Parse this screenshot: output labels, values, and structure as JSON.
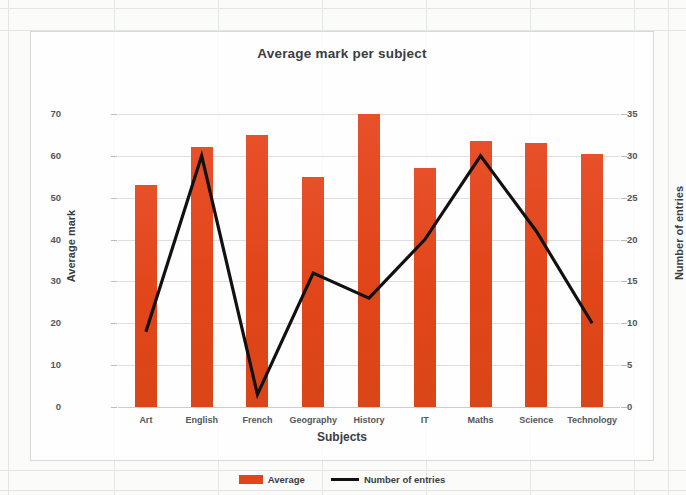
{
  "chart_data": {
    "type": "bar",
    "title": "Average mark per subject",
    "xlabel": "Subjects",
    "ylabel": "Average mark",
    "y2label": "Number of entries",
    "categories": [
      "Art",
      "English",
      "French",
      "Geography",
      "History",
      "IT",
      "Maths",
      "Science",
      "Technology"
    ],
    "ylim": [
      0,
      70
    ],
    "y2lim": [
      0,
      35
    ],
    "yticks": [
      0,
      10,
      20,
      30,
      40,
      50,
      60,
      70
    ],
    "y2ticks": [
      0,
      5,
      10,
      15,
      20,
      25,
      30,
      35
    ],
    "grid": true,
    "legend_position": "bottom",
    "series": [
      {
        "name": "Average",
        "type": "bar",
        "axis": "left",
        "color": "#e14519",
        "values": [
          53,
          62,
          65,
          55,
          70,
          57,
          63.5,
          63,
          60.5
        ]
      },
      {
        "name": "Number of entries",
        "type": "line",
        "axis": "right",
        "color": "#111111",
        "values": [
          9,
          30,
          1.5,
          16,
          13,
          20,
          30,
          21,
          10
        ]
      }
    ]
  },
  "legend": {
    "items": [
      {
        "label": "Average"
      },
      {
        "label": "Number of entries"
      }
    ]
  },
  "colors": {
    "bar": "#e14519",
    "line": "#111111",
    "grid": "#dcdee1",
    "text": "#3a3d42"
  }
}
